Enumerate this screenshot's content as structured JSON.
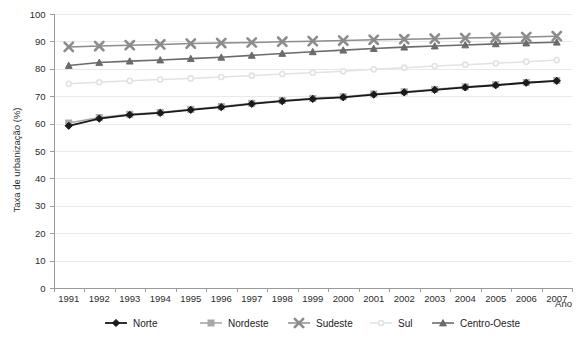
{
  "chart_data": {
    "type": "line",
    "title": "",
    "xlabel": "Ano",
    "ylabel": "Taxa de urbanização (%)",
    "x": [
      1991,
      1992,
      1993,
      1994,
      1995,
      1996,
      1997,
      1998,
      1999,
      2000,
      2001,
      2002,
      2003,
      2004,
      2005,
      2006,
      2007
    ],
    "xtick_labels": [
      "1991",
      "1992",
      "1993",
      "1994",
      "1995",
      "1996",
      "1997",
      "1998",
      "1999",
      "2000",
      "2001",
      "2002",
      "2003",
      "2004",
      "2005",
      "2006",
      "2007"
    ],
    "ylim": [
      0,
      100
    ],
    "ytick_labels": [
      "0",
      "10",
      "20",
      "30",
      "40",
      "50",
      "60",
      "70",
      "80",
      "90",
      "100"
    ],
    "ytick_values": [
      0,
      10,
      20,
      30,
      40,
      50,
      60,
      70,
      80,
      90,
      100
    ],
    "grid": true,
    "legend_position": "bottom",
    "series": [
      {
        "name": "Norte",
        "marker": "diamond",
        "color": "#1a1a1a",
        "values": [
          59.2,
          61.8,
          63.2,
          63.9,
          65.0,
          66.0,
          67.2,
          68.2,
          69.0,
          69.6,
          70.6,
          71.4,
          72.3,
          73.2,
          74.0,
          74.9,
          75.6
        ]
      },
      {
        "name": "Nordeste",
        "marker": "square",
        "color": "#a8a8a8",
        "values": [
          60.2,
          62.2,
          63.4,
          64.1,
          65.2,
          66.2,
          67.4,
          68.4,
          69.2,
          69.8,
          70.8,
          71.6,
          72.5,
          73.4,
          74.2,
          75.0,
          75.7
        ]
      },
      {
        "name": "Sudeste",
        "marker": "x",
        "color": "#8c8c8c",
        "values": [
          88.0,
          88.3,
          88.6,
          88.9,
          89.2,
          89.4,
          89.6,
          89.9,
          90.1,
          90.3,
          90.6,
          90.8,
          91.0,
          91.2,
          91.4,
          91.6,
          91.9
        ]
      },
      {
        "name": "Sul",
        "marker": "circle",
        "color": "#e2e2e2",
        "values": [
          74.5,
          75.1,
          75.6,
          76.1,
          76.5,
          77.0,
          77.5,
          78.1,
          78.6,
          79.1,
          79.8,
          80.4,
          81.0,
          81.5,
          82.0,
          82.6,
          83.2
        ]
      },
      {
        "name": "Centro-Oeste",
        "marker": "triangle",
        "color": "#6b6b6b",
        "values": [
          81.2,
          82.3,
          82.8,
          83.2,
          83.7,
          84.2,
          84.9,
          85.6,
          86.2,
          86.8,
          87.4,
          87.9,
          88.3,
          88.7,
          89.1,
          89.4,
          89.7
        ]
      }
    ]
  },
  "axes": {
    "y_title": "Taxa de urbanização (%)",
    "x_title": "Ano"
  },
  "legend": {
    "items": [
      {
        "label": "Norte"
      },
      {
        "label": "Nordeste"
      },
      {
        "label": "Sudeste"
      },
      {
        "label": "Sul"
      },
      {
        "label": "Centro-Oeste"
      }
    ]
  }
}
